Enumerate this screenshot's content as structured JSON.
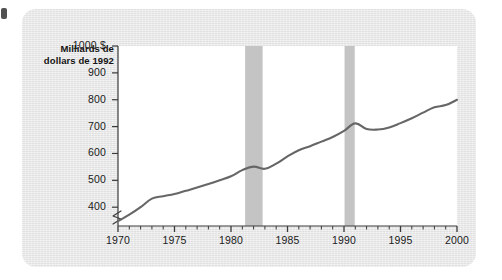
{
  "figure": {
    "background_color": "#e9e9e9",
    "plot_background_color": "#ffffff",
    "line_color": "#666666",
    "band_color": "#c4c4c4",
    "axis_color": "#3a3a3a"
  },
  "chart_data": {
    "type": "line",
    "title": "Milliards de dollars de 1992",
    "title_line_1": "Milliards de",
    "title_line_2": "dollars de 1992",
    "xlabel": "",
    "ylabel": "Milliards de dollars de 1992",
    "xlim": [
      1970,
      2000
    ],
    "ylim": [
      330,
      1000
    ],
    "ybreak": true,
    "grid": false,
    "legend": null,
    "ytick_labels": [
      "1000 $",
      "900",
      "800",
      "700",
      "600",
      "500",
      "400"
    ],
    "ytick_values": [
      1000,
      900,
      800,
      700,
      600,
      500,
      400
    ],
    "xtick_labels": [
      "1970",
      "1975",
      "1980",
      "1985",
      "1990",
      "1995",
      "2000"
    ],
    "xtick_values": [
      1970,
      1975,
      1980,
      1985,
      1990,
      1995,
      2000
    ],
    "xminor_step": 1,
    "x": [
      1970,
      1971,
      1972,
      1973,
      1974,
      1975,
      1976,
      1977,
      1978,
      1979,
      1980,
      1981,
      1982,
      1983,
      1984,
      1985,
      1986,
      1987,
      1988,
      1989,
      1990,
      1991,
      1992,
      1993,
      1994,
      1995,
      1996,
      1997,
      1998,
      1999,
      2000
    ],
    "values": [
      348,
      372,
      400,
      432,
      441,
      449,
      461,
      473,
      486,
      500,
      515,
      538,
      551,
      543,
      562,
      589,
      612,
      627,
      644,
      661,
      684,
      712,
      691,
      689,
      697,
      713,
      731,
      752,
      772,
      780,
      800
    ],
    "series": [
      {
        "name": "Milliards de dollars de 1992",
        "values": [
          348,
          372,
          400,
          432,
          441,
          449,
          461,
          473,
          486,
          500,
          515,
          538,
          551,
          543,
          562,
          589,
          612,
          627,
          644,
          661,
          684,
          712,
          691,
          689,
          697,
          713,
          731,
          752,
          772,
          780,
          800
        ]
      }
    ],
    "shaded_bands": [
      {
        "name": "recession-band-1",
        "start": 1981.25,
        "end": 1982.8
      },
      {
        "name": "recession-band-2",
        "start": 1990.05,
        "end": 1990.95
      }
    ]
  }
}
